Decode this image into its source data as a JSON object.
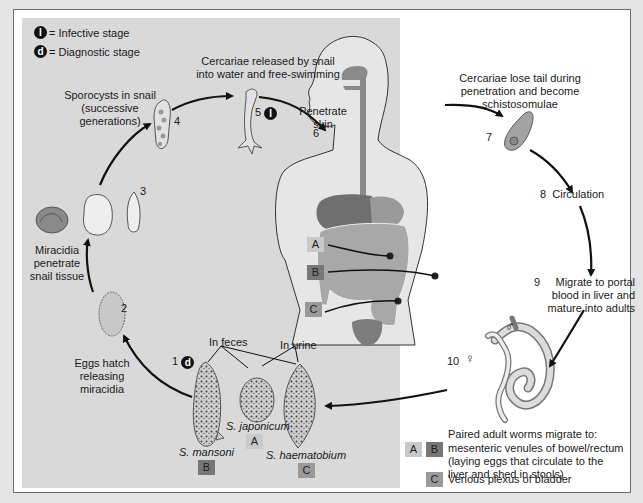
{
  "legend": {
    "infective": {
      "symbol": "I",
      "text": "= Infective stage"
    },
    "diagnostic": {
      "symbol": "d",
      "text": "= Diagnostic stage"
    }
  },
  "stages": [
    {
      "num": "1",
      "text": "",
      "badge": "d"
    },
    {
      "num": "2",
      "text": "Eggs hatch\nreleasing\nmiracidia"
    },
    {
      "num": "",
      "text": "Miracidia\npenetrate\nsnail tissue"
    },
    {
      "num": "3",
      "text": ""
    },
    {
      "num": "4",
      "text": "Sporocysts in snail\n(successive\ngenerations)"
    },
    {
      "num": "5",
      "text": "Cercariae released by snail\ninto water and free-swimming",
      "badge": "I"
    },
    {
      "num": "6",
      "text": "Penetrate\nskin"
    },
    {
      "num": "7",
      "text": "Cercariae lose tail during\npenetration and become\nschistosomulae"
    },
    {
      "num": "8",
      "text": "Circulation"
    },
    {
      "num": "9",
      "text": "Migrate to portal\nblood in liver and\nmature into adults"
    },
    {
      "num": "10",
      "text": ""
    }
  ],
  "labels": {
    "eggs_hatch": [
      "Eggs hatch",
      "releasing",
      "miracidia"
    ],
    "miracidia": [
      "Miracidia",
      "penetrate",
      "snail tissue"
    ],
    "sporocysts": [
      "Sporocysts in snail",
      "(successive",
      "generations)"
    ],
    "cercariae_released": [
      "Cercariae released by snail",
      "into water and free-swimming"
    ],
    "penetrate": [
      "Penetrate",
      "skin"
    ],
    "lose_tail": [
      "Cercariae lose tail during",
      "penetration and become",
      "schistosomulae"
    ],
    "circulation": "Circulation",
    "migrate": [
      "Migrate to portal",
      "blood in liver and",
      "mature into adults"
    ],
    "in_feces": "In feces",
    "in_urine": "In urine",
    "male_symbol": "♂",
    "female_symbol": "♀"
  },
  "species": [
    {
      "name": "S. mansoni",
      "box": "B"
    },
    {
      "name": "S. japonicum",
      "box": "A"
    },
    {
      "name": "S. haematobium",
      "box": "C"
    }
  ],
  "organ_boxes": [
    "A",
    "B",
    "C"
  ],
  "adult_sites": {
    "line1": "Paired adult worms migrate to:",
    "ab_boxes": [
      "A",
      "B"
    ],
    "ab_text": [
      "mesenteric venules of bowel/rectum",
      "(laying eggs that circulate to the",
      "liver and shed in stools)"
    ],
    "c_box": "C",
    "c_text": "Venous plexus of bladder"
  },
  "colors": {
    "panel_gray": "#d9d9d9",
    "organ_gray": "#8a8a8a",
    "box_A": "#c9c9c9",
    "box_B": "#777777",
    "box_C": "#9a9a9a"
  }
}
